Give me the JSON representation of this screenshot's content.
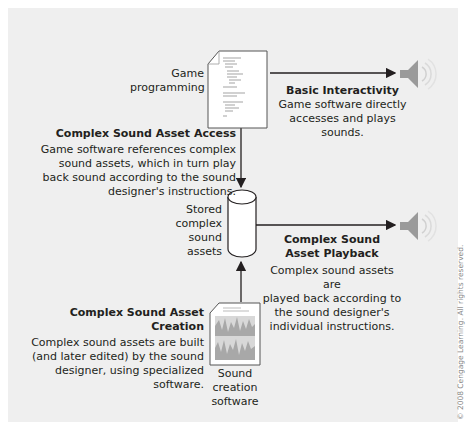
{
  "nodes": {
    "game_programming": {
      "label": "Game\nprogramming",
      "line1": "Game",
      "line2": "programming"
    },
    "stored_assets": {
      "line1": "Stored",
      "line2": "complex",
      "line3": "sound",
      "line4": "assets"
    },
    "sound_creation": {
      "line1": "Sound",
      "line2": "creation",
      "line3": "software"
    }
  },
  "annotations": {
    "basic_interactivity": {
      "title": "Basic Interactivity",
      "line1": "Game software directly",
      "line2": "accesses and plays sounds."
    },
    "asset_access": {
      "title": "Complex Sound Asset Access",
      "line1": "Game software references complex",
      "line2": "sound assets, which in turn play",
      "line3": "back sound according to the sound",
      "line4": "designer's instructions."
    },
    "asset_playback": {
      "title1": "Complex Sound",
      "title2": "Asset Playback",
      "line1": "Complex sound assets are",
      "line2": "played back according to",
      "line3": "the sound designer's",
      "line4": "individual instructions."
    },
    "asset_creation": {
      "title": "Complex Sound Asset Creation",
      "line1": "Complex sound assets are built",
      "line2": "(and later edited) by the sound",
      "line3": "designer, using specialized software."
    }
  },
  "icons": {
    "document": "code-document-icon",
    "database": "database-cylinder-icon",
    "waveform": "waveform-document-icon",
    "speaker": "speaker-icon"
  },
  "colors": {
    "panel": "#efefef",
    "line": "#231f20",
    "speaker": "#9a9a9a"
  },
  "copyright": "© 2008 Cengage Learning. All rights reserved."
}
